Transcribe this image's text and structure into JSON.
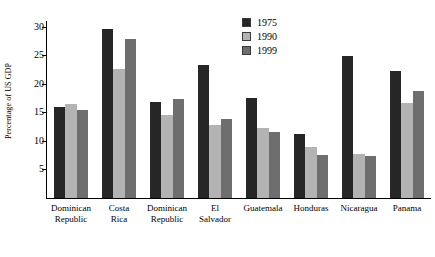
{
  "chart_data": {
    "type": "bar",
    "title": "",
    "xlabel": "",
    "ylabel": "Percentage of US GDP",
    "ylim": [
      0,
      31
    ],
    "yticks": [
      5,
      10,
      15,
      20,
      25,
      30
    ],
    "grid": false,
    "legend_position": "top-right",
    "categories": [
      "Dominican\nRepublic",
      "Costa\nRica",
      "Dominican\nRepublic",
      "El\nSalvador",
      "Guatemala",
      "Honduras",
      "Nicaragua",
      "Panama"
    ],
    "category_lines": [
      [
        "Dominican",
        "Republic"
      ],
      [
        "Costa",
        "Rica"
      ],
      [
        "Dominican",
        "Republic"
      ],
      [
        "El",
        "Salvador"
      ],
      [
        "Guatemala"
      ],
      [
        "Honduras"
      ],
      [
        "Nicaragua"
      ],
      [
        "Panama"
      ]
    ],
    "series": [
      {
        "name": "1975",
        "color": "#262626",
        "values": [
          15.9,
          29.6,
          16.9,
          23.3,
          17.5,
          11.2,
          24.8,
          22.2
        ]
      },
      {
        "name": "1990",
        "color": "#b3b3b3",
        "values": [
          16.4,
          22.6,
          14.5,
          12.8,
          12.2,
          9.0,
          7.7,
          16.7
        ]
      },
      {
        "name": "1999",
        "color": "#6e6e6e",
        "values": [
          15.5,
          27.9,
          17.4,
          13.9,
          11.6,
          7.5,
          7.4,
          18.7
        ]
      }
    ]
  },
  "colors": {
    "series_1975": "#262626",
    "series_1990": "#b3b3b3",
    "series_1999": "#6e6e6e",
    "axis": "#000000",
    "background": "#ffffff"
  }
}
